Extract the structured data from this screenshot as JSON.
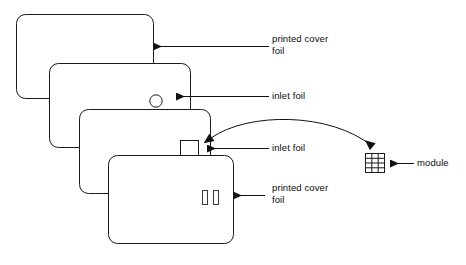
{
  "diagram": {
    "stroke_color": "#1a1a1a",
    "background_color": "#ffffff",
    "cards": [
      {
        "id": "card-1",
        "name": "printed-cover-foil-top",
        "feature": "none",
        "feature_label": ""
      },
      {
        "id": "card-2",
        "name": "inlet-foil-top",
        "feature": "circle-hole",
        "feature_label": ""
      },
      {
        "id": "card-3",
        "name": "inlet-foil-bottom",
        "feature": "square-cavity",
        "feature_label": ""
      },
      {
        "id": "card-4",
        "name": "printed-cover-foil-bottom",
        "feature": "two-bars",
        "feature_label": ""
      }
    ],
    "labels": {
      "printed_cover_foil_top": "printed cover\nfoil",
      "inlet_foil_top": "inlet foil",
      "inlet_foil_bottom": "inlet foil",
      "printed_cover_foil_bottom": "printed cover\nfoil",
      "module": "module"
    },
    "module": {
      "name": "module",
      "shape": "rectangle-with-contact-grid",
      "grid_columns": 3,
      "grid_rows": 4
    },
    "connectors": [
      {
        "name": "leader-printed-cover-foil-top",
        "type": "straight-arrow",
        "direction": "left"
      },
      {
        "name": "leader-inlet-foil-top",
        "type": "straight-arrow",
        "direction": "left"
      },
      {
        "name": "leader-inlet-foil-bottom",
        "type": "straight-arrow",
        "direction": "left"
      },
      {
        "name": "leader-printed-cover-foil-bottom",
        "type": "straight-arrow",
        "direction": "left"
      },
      {
        "name": "leader-module",
        "type": "straight-arrow",
        "direction": "left"
      },
      {
        "name": "module-placement-arc",
        "type": "curved-double-arrow",
        "direction": "bidirectional"
      }
    ]
  }
}
